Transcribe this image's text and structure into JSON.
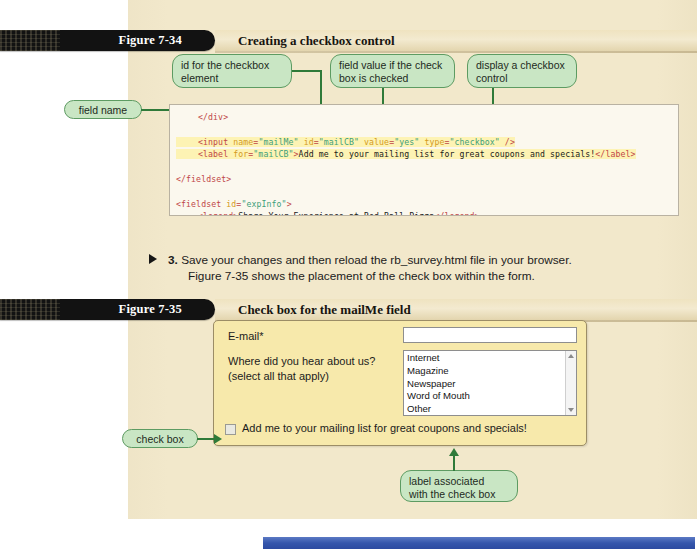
{
  "figure_734": {
    "number": "Figure 7-34",
    "title": "Creating a checkbox control",
    "callouts": {
      "id_checkbox": "id for the checkbox element",
      "field_value": "field value if the check box is checked",
      "display_checkbox": "display a checkbox control",
      "field_name": "field name",
      "check_box_label": "check box label"
    },
    "code": {
      "line1": "</div>",
      "line2": "<input name=\"mailMe\" id=\"mailCB\" value=\"yes\" type=\"checkbox\" />",
      "line3": "<label for=\"mailCB\">Add me to your mailing list for great coupons and specials!</label>",
      "line4": "</fieldset>",
      "line5": "<fieldset id=\"expInfo\">",
      "line6": "<legend>Share Your Experience at Red Ball Pizza</legend>"
    }
  },
  "step3": {
    "number": "3.",
    "line1": "Save your changes and then reload the rb_survey.html file in your browser.",
    "line2": "Figure 7-35 shows the placement of the check box within the form."
  },
  "figure_735": {
    "number": "Figure 7-35",
    "title": "Check box for the mailMe field",
    "callouts": {
      "check_box": "check box",
      "label_assoc_line1": "label associated",
      "label_assoc_line2": "with the check box"
    },
    "form": {
      "email_label": "E-mail*",
      "email_value": "",
      "hear_label_line1": "Where did you hear about us?",
      "hear_label_line2": "(select all that apply)",
      "listbox_options": [
        "Internet",
        "Magazine",
        "Newspaper",
        "Word of Mouth",
        "Other"
      ],
      "checkbox_label": "Add me to your mailing list for great coupons and specials!",
      "checkbox_checked": false
    }
  },
  "colors": {
    "page_cream": "#f2e8cb",
    "callout_green_fill": "#c9e6c4",
    "callout_green_border": "#5d9b62",
    "connector_green": "#2f7a39",
    "code_bg": "#fbf8ee",
    "code_highlight": "#fdf3b4",
    "code_tag": "#c04646",
    "code_attr": "#d49a22",
    "code_value": "#3d9f7a",
    "form_yellow": "#f7e9ab",
    "bar_black": "#121212",
    "bar_cream": "#f3ead0",
    "bottom_blue": "#3556ac"
  }
}
